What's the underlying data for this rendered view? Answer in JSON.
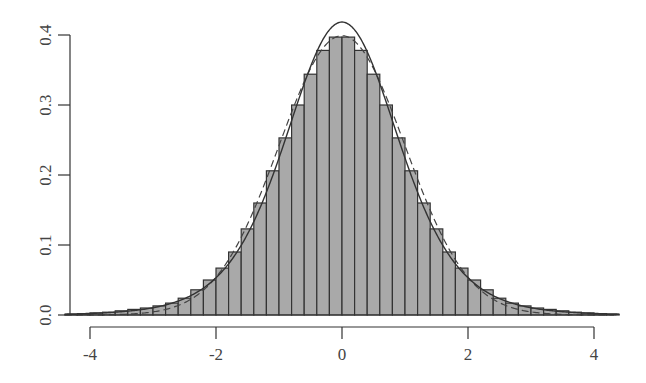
{
  "chart_data": {
    "type": "bar",
    "subtype": "histogram_with_density_curves",
    "title": "",
    "xlabel": "",
    "ylabel": "",
    "bin_width": 0.2,
    "bin_edges_start": -4.4,
    "bin_edges_end": 4.4,
    "bin_centers": [
      -4.3,
      -4.1,
      -3.9,
      -3.7,
      -3.5,
      -3.3,
      -3.1,
      -2.9,
      -2.7,
      -2.5,
      -2.3,
      -2.1,
      -1.9,
      -1.7,
      -1.5,
      -1.3,
      -1.1,
      -0.9,
      -0.7,
      -0.5,
      -0.3,
      -0.1,
      0.1,
      0.3,
      0.5,
      0.7,
      0.9,
      1.1,
      1.3,
      1.5,
      1.7,
      1.9,
      2.1,
      2.3,
      2.5,
      2.7,
      2.9,
      3.1,
      3.3,
      3.5,
      3.7,
      3.9,
      4.1,
      4.3
    ],
    "values": [
      0.001,
      0.002,
      0.003,
      0.004,
      0.006,
      0.008,
      0.01,
      0.013,
      0.017,
      0.024,
      0.036,
      0.05,
      0.067,
      0.09,
      0.123,
      0.16,
      0.206,
      0.253,
      0.3,
      0.344,
      0.378,
      0.397,
      0.397,
      0.378,
      0.344,
      0.3,
      0.253,
      0.206,
      0.16,
      0.123,
      0.09,
      0.067,
      0.05,
      0.036,
      0.024,
      0.017,
      0.013,
      0.01,
      0.008,
      0.006,
      0.004,
      0.003,
      0.002,
      0.001
    ],
    "series": [
      {
        "name": "histogram",
        "style": "bars",
        "color": "#a9a9a9"
      },
      {
        "name": "fitted density",
        "style": "solid line",
        "color": "#333333"
      },
      {
        "name": "normal density",
        "style": "dashed line",
        "color": "#444444"
      }
    ],
    "xlim": [
      -4.4,
      4.4
    ],
    "ylim": [
      0,
      0.4
    ],
    "x_ticks": [
      "-4",
      "-2",
      "0",
      "2",
      "4"
    ],
    "y_ticks": [
      "0.0",
      "0.1",
      "0.2",
      "0.3",
      "0.4"
    ],
    "grid": false,
    "legend": "none"
  },
  "axes": {
    "x_ticks": [
      {
        "value": -4,
        "label": "-4"
      },
      {
        "value": -2,
        "label": "-2"
      },
      {
        "value": 0,
        "label": "0"
      },
      {
        "value": 2,
        "label": "2"
      },
      {
        "value": 4,
        "label": "4"
      }
    ],
    "y_ticks": [
      {
        "value": 0.0,
        "label": "0.0"
      },
      {
        "value": 0.1,
        "label": "0.1"
      },
      {
        "value": 0.2,
        "label": "0.2"
      },
      {
        "value": 0.3,
        "label": "0.3"
      },
      {
        "value": 0.4,
        "label": "0.4"
      }
    ]
  },
  "colors": {
    "bar_fill": "#a9a9a9",
    "bar_stroke": "#333333",
    "axis": "#333333"
  }
}
